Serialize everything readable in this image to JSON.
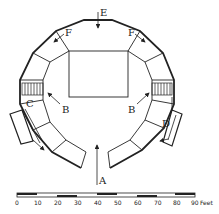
{
  "diagram": {
    "type": "architectural-plan",
    "labels": {
      "A": "A",
      "B_left": "B",
      "B_right": "B",
      "C": "C",
      "D": "D",
      "E": "E",
      "F_left": "F",
      "F_right": "F"
    },
    "scale_bar": {
      "ticks": [
        "0",
        "10",
        "20",
        "30",
        "40",
        "50",
        "60",
        "70",
        "80",
        "90"
      ],
      "unit": "Feet"
    },
    "colors": {
      "line": "#222222",
      "background": "#ffffff"
    }
  }
}
